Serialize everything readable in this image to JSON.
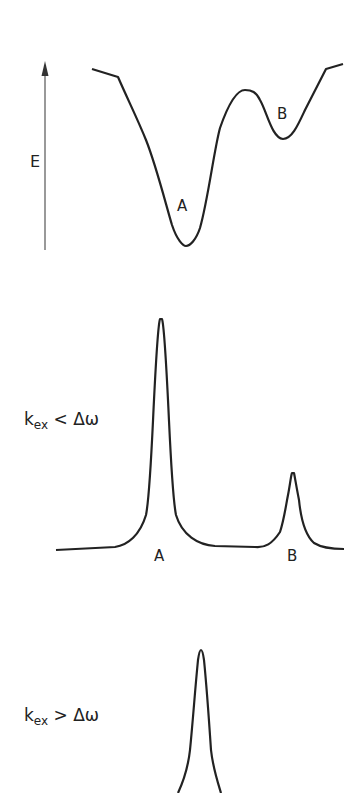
{
  "panels": {
    "energy": {
      "axis_label": "E",
      "well_a_label": "A",
      "well_b_label": "B"
    },
    "slow_exchange": {
      "condition_k": "k",
      "condition_sub": "ex",
      "condition_rel": " < Δω",
      "peak_a_label": "A",
      "peak_b_label": "B"
    },
    "fast_exchange": {
      "condition_k": "k",
      "condition_sub": "ex",
      "condition_rel": " > Δω"
    }
  },
  "colors": {
    "line": "#222222",
    "axis": "#555555",
    "background": "#ffffff"
  }
}
